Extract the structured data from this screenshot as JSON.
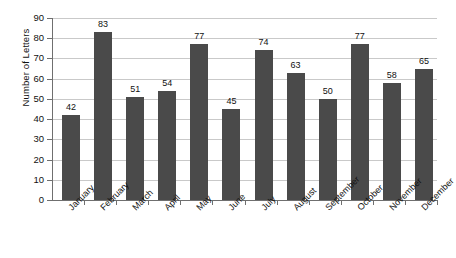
{
  "chart_data": {
    "type": "bar",
    "title": "",
    "subtitle": "",
    "xlabel": "",
    "ylabel": "Number of Letters",
    "categories": [
      "January",
      "February",
      "March",
      "April",
      "May",
      "June",
      "July",
      "August",
      "September",
      "October",
      "November",
      "December"
    ],
    "values": [
      42,
      83,
      51,
      54,
      77,
      45,
      74,
      63,
      50,
      77,
      58,
      65
    ],
    "data_labels": [
      "42",
      "83",
      "51",
      "54",
      "77",
      "45",
      "74",
      "63",
      "50",
      "77",
      "58",
      "65"
    ],
    "ylim": [
      0,
      90
    ],
    "ytick_step": 10,
    "ytick_labels": [
      "0",
      "10",
      "20",
      "30",
      "40",
      "50",
      "60",
      "70",
      "80",
      "90"
    ],
    "grid": true,
    "grid_axis": "y",
    "legend": false,
    "legend_position": "none",
    "bar_color": "#4a4a4a",
    "gridline_color": "#c9c9c9",
    "axis_color": "#6f6f6f",
    "background_color": "#ffffff",
    "xtick_label_rotation": -45
  }
}
